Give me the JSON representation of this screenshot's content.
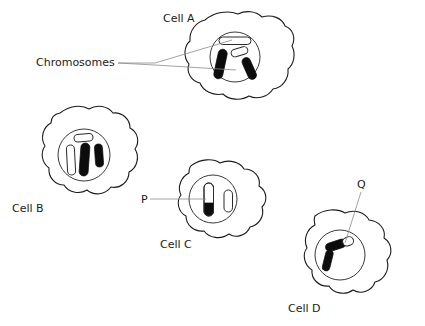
{
  "diagram": {
    "background_color": "#ffffff",
    "ink_color": "#1b1b1b",
    "leader_color": "#8a8a8a",
    "chromosome_dark_color": "#0c0c0c",
    "chromosome_light_color": "#ffffff"
  },
  "labels": {
    "chromosomes": "Chromosomes",
    "cell_a": "Cell A",
    "cell_b": "Cell B",
    "cell_c": "Cell C",
    "cell_d": "Cell D",
    "pointer_p": "P",
    "pointer_q": "Q"
  },
  "cells": [
    {
      "id": "cell-a",
      "name": "Cell A",
      "label_position": {
        "x": 163,
        "y": 22
      },
      "nucleus_center": {
        "x": 235,
        "y": 57
      },
      "nucleus_radius": 25,
      "chromosomes": [
        {
          "id": "a-chr-1",
          "shade": "light",
          "orientation": "horizontal",
          "length": 30,
          "width": 7
        },
        {
          "id": "a-chr-2",
          "shade": "light",
          "orientation": "diagonal-right",
          "length": 16,
          "width": 7
        },
        {
          "id": "a-chr-3",
          "shade": "dark",
          "orientation": "diagonal-left",
          "length": 30,
          "width": 8
        },
        {
          "id": "a-chr-4",
          "shade": "dark",
          "orientation": "diagonal-right",
          "length": 22,
          "width": 8
        }
      ]
    },
    {
      "id": "cell-b",
      "name": "Cell B",
      "label_position": {
        "x": 12,
        "y": 212
      },
      "nucleus_center": {
        "x": 84,
        "y": 155
      },
      "nucleus_radius": 26,
      "chromosomes": [
        {
          "id": "b-chr-1",
          "shade": "light",
          "orientation": "horizontal",
          "length": 17,
          "width": 7
        },
        {
          "id": "b-chr-2",
          "shade": "light",
          "orientation": "vertical",
          "length": 30,
          "width": 7
        },
        {
          "id": "b-chr-3",
          "shade": "dark",
          "orientation": "vertical",
          "length": 33,
          "width": 8
        },
        {
          "id": "b-chr-4",
          "shade": "dark",
          "orientation": "vertical",
          "length": 22,
          "width": 8
        }
      ]
    },
    {
      "id": "cell-c",
      "name": "Cell C",
      "label_position": {
        "x": 160,
        "y": 248
      },
      "nucleus_center": {
        "x": 213,
        "y": 199
      },
      "nucleus_radius": 24,
      "chromosomes": [
        {
          "id": "c-chr-1",
          "shade": "half-dark-bottom",
          "orientation": "vertical",
          "length": 33,
          "width": 9
        },
        {
          "id": "c-chr-2",
          "shade": "light",
          "orientation": "vertical",
          "length": 22,
          "width": 8
        }
      ]
    },
    {
      "id": "cell-d",
      "name": "Cell D",
      "label_position": {
        "x": 288,
        "y": 312
      },
      "nucleus_center": {
        "x": 340,
        "y": 255
      },
      "nucleus_radius": 25,
      "chromosomes": [
        {
          "id": "d-chr-1",
          "shade": "dark-with-light-tip",
          "orientation": "diagonal-right",
          "length": 28,
          "width": 8
        },
        {
          "id": "d-chr-2",
          "shade": "dark",
          "orientation": "diagonal-left",
          "length": 20,
          "width": 7
        }
      ]
    }
  ],
  "annotations": [
    {
      "id": "annotation-chromosomes",
      "text": "Chromosomes",
      "text_position": {
        "x": 36,
        "y": 66
      },
      "leader_targets": [
        {
          "x": 232,
          "y": 40
        },
        {
          "x": 236,
          "y": 70
        }
      ]
    },
    {
      "id": "annotation-p",
      "text": "P",
      "text_position": {
        "x": 141,
        "y": 203
      },
      "leader_targets": [
        {
          "x": 205,
          "y": 199
        }
      ]
    },
    {
      "id": "annotation-q",
      "text": "Q",
      "text_position": {
        "x": 357,
        "y": 188
      },
      "leader_targets": [
        {
          "x": 345,
          "y": 243
        }
      ]
    }
  ]
}
